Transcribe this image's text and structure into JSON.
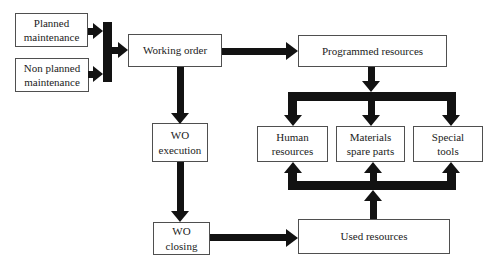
{
  "diagram": {
    "nodes": {
      "planned": {
        "label": "Planned\nmaintenance"
      },
      "nonplanned": {
        "label": "Non planned\nmaintenance"
      },
      "working": {
        "label": "Working order"
      },
      "programmed": {
        "label": "Programmed resources"
      },
      "wo_execution": {
        "label": "WO\nexecution"
      },
      "wo_closing": {
        "label": "WO\nclosing"
      },
      "human": {
        "label": "Human\nresources"
      },
      "materials": {
        "label": "Materials\nspare parts"
      },
      "special": {
        "label": "Special\ntools"
      },
      "used": {
        "label": "Used resources"
      }
    },
    "edges": [
      {
        "from": "planned",
        "to": "working"
      },
      {
        "from": "nonplanned",
        "to": "working"
      },
      {
        "from": "working",
        "to": "programmed"
      },
      {
        "from": "working",
        "to": "wo_execution"
      },
      {
        "from": "programmed",
        "to": "human"
      },
      {
        "from": "programmed",
        "to": "materials"
      },
      {
        "from": "programmed",
        "to": "special"
      },
      {
        "from": "wo_execution",
        "to": "wo_closing"
      },
      {
        "from": "wo_closing",
        "to": "used"
      },
      {
        "from": "used",
        "to": "human"
      },
      {
        "from": "used",
        "to": "materials"
      },
      {
        "from": "used",
        "to": "special"
      }
    ],
    "colors": {
      "arrow": "#121212",
      "box_border": "#4f4f4f",
      "box_fill": "#ffffff",
      "text": "#1b1b1b",
      "background": "#ffffff"
    }
  }
}
